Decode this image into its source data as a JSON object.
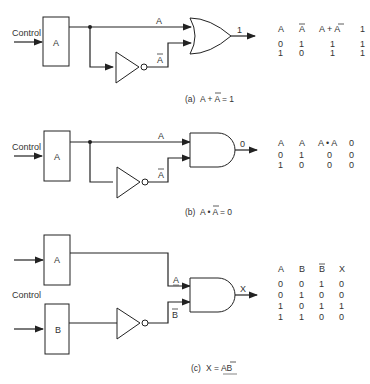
{
  "diagram_a": {
    "control_label": "Control",
    "box_label": "A",
    "wire_top_label": "A",
    "wire_bottom_label": "A",
    "gate": "OR",
    "output_label": "1",
    "table": {
      "headers": [
        "A",
        "A",
        "A + A",
        "1"
      ],
      "header_overlines": [
        false,
        true,
        false,
        false
      ],
      "rows": [
        [
          "0",
          "1",
          "1",
          "1"
        ],
        [
          "1",
          "0",
          "1",
          "1"
        ]
      ]
    },
    "caption_prefix": "(a)",
    "caption_expr": "A + A = 1"
  },
  "diagram_b": {
    "control_label": "Control",
    "box_label": "A",
    "wire_top_label": "A",
    "wire_bottom_label": "A",
    "gate": "AND",
    "output_label": "0",
    "table": {
      "headers": [
        "A",
        "A",
        "A • A",
        "0"
      ],
      "rows": [
        [
          "0",
          "1",
          "0",
          "0"
        ],
        [
          "1",
          "0",
          "0",
          "0"
        ]
      ]
    },
    "caption_prefix": "(b)",
    "caption_expr": "A • A = 0"
  },
  "diagram_c": {
    "control_label": "Control",
    "box_top_label": "A",
    "box_bottom_label": "B",
    "wire_top_label": "A",
    "wire_bottom_label": "B",
    "gate": "AND",
    "output_label": "X",
    "table": {
      "headers": [
        "A",
        "B",
        "B",
        "X"
      ],
      "rows": [
        [
          "0",
          "0",
          "1",
          "0"
        ],
        [
          "0",
          "1",
          "0",
          "0"
        ],
        [
          "1",
          "0",
          "1",
          "1"
        ],
        [
          "1",
          "1",
          "0",
          "0"
        ]
      ]
    },
    "caption_prefix": "(c)",
    "caption_expr": "X = AB"
  }
}
